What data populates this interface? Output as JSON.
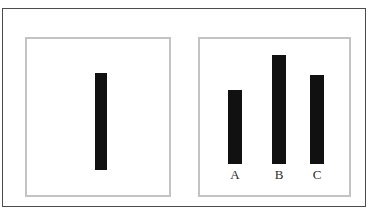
{
  "figure": {
    "background_color": "#ffffff",
    "outer_frame_color": "#4c4c4c",
    "panel_border_color": "#c3c3c3",
    "bar_color": "#111111",
    "label_color": "#2b2b2b",
    "top_text_remnant": "",
    "width": 372,
    "height": 215
  },
  "panels": {
    "left": {
      "name": "single-bar-panel",
      "bars": [
        {
          "label": "",
          "value": 97,
          "x": 68,
          "width": 12,
          "height_px": 97
        }
      ]
    },
    "right": {
      "name": "three-bar-panel",
      "bars": [
        {
          "label": "A",
          "value": 74,
          "x": 28,
          "width": 14,
          "height_px": 74
        },
        {
          "label": "B",
          "value": 109,
          "x": 72,
          "width": 14,
          "height_px": 109
        },
        {
          "label": "C",
          "value": 89,
          "x": 110,
          "width": 14,
          "height_px": 89
        }
      ]
    }
  },
  "chart_data": {
    "type": "bar",
    "title": "",
    "xlabel": "",
    "ylabel": "",
    "grid": false,
    "legend": "none",
    "panels": [
      {
        "name": "left",
        "categories": [
          ""
        ],
        "values": [
          97
        ],
        "ylim": [
          0,
          115
        ],
        "note": "single unlabeled tall black bar"
      },
      {
        "name": "right",
        "categories": [
          "A",
          "B",
          "C"
        ],
        "values": [
          74,
          109,
          89
        ],
        "ylim": [
          0,
          115
        ],
        "note": "three black bars labeled A, B, C; B is tallest, A is shortest"
      }
    ]
  }
}
